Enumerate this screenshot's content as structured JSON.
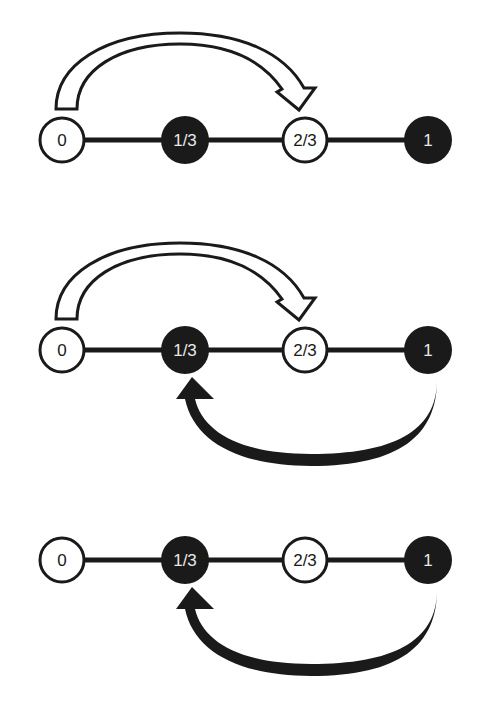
{
  "colors": {
    "dark": "#1a1a1a",
    "light": "#ffffff",
    "dark_text": "#e8e8e8",
    "light_text": "#1a1a1a"
  },
  "node_labels": [
    "0",
    "1/3",
    "2/3",
    "1"
  ],
  "node_fill": [
    "light",
    "dark",
    "light",
    "dark"
  ],
  "panels": [
    {
      "id": "panel-1",
      "nodes": [
        "0",
        "1/3",
        "2/3",
        "1"
      ],
      "arrows": [
        {
          "from": "0",
          "to": "2/3",
          "style": "outlined-white",
          "position": "above"
        }
      ]
    },
    {
      "id": "panel-2",
      "nodes": [
        "0",
        "1/3",
        "2/3",
        "1"
      ],
      "arrows": [
        {
          "from": "0",
          "to": "2/3",
          "style": "outlined-white",
          "position": "above"
        },
        {
          "from": "1",
          "to": "1/3",
          "style": "solid-black",
          "position": "below"
        }
      ]
    },
    {
      "id": "panel-3",
      "nodes": [
        "0",
        "1/3",
        "2/3",
        "1"
      ],
      "arrows": [
        {
          "from": "1",
          "to": "1/3",
          "style": "solid-black",
          "position": "below"
        }
      ]
    }
  ]
}
